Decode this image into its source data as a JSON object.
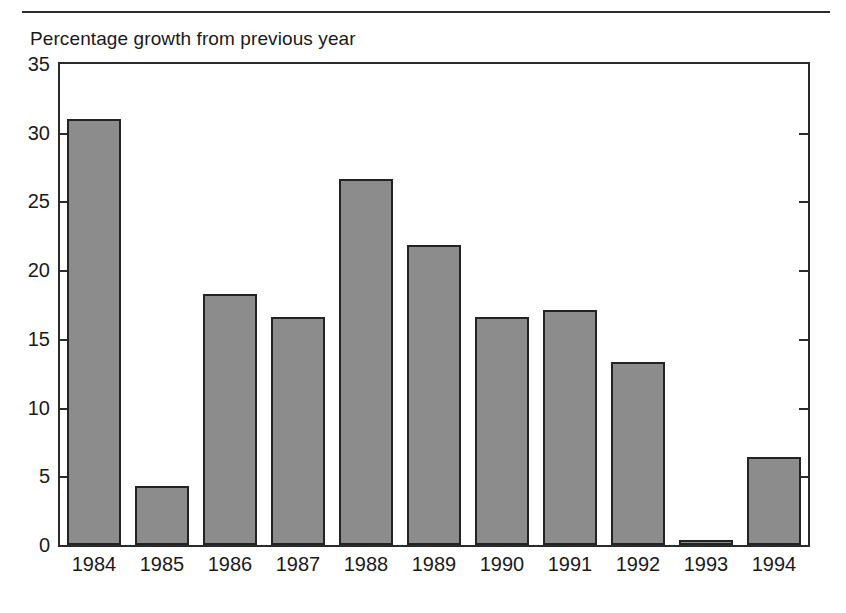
{
  "chart_data": {
    "type": "bar",
    "title": "Percentage growth from previous year",
    "xlabel": "",
    "ylabel": "",
    "categories": [
      "1984",
      "1985",
      "1986",
      "1987",
      "1988",
      "1989",
      "1990",
      "1991",
      "1992",
      "1993",
      "1994"
    ],
    "values": [
      31.0,
      4.3,
      18.3,
      16.6,
      26.6,
      21.8,
      16.6,
      17.1,
      13.3,
      0.4,
      6.4
    ],
    "ylim": [
      0,
      35
    ],
    "yticks": [
      0,
      5,
      10,
      15,
      20,
      25,
      30,
      35
    ],
    "ytick_labels": [
      "0",
      "5",
      "10",
      "15",
      "20",
      "25",
      "30",
      "35"
    ],
    "grid": false,
    "legend": null,
    "legend_position": "none",
    "series": [
      {
        "name": "Percentage growth from previous year",
        "values": [
          31.0,
          4.3,
          18.3,
          16.6,
          26.6,
          21.8,
          16.6,
          17.1,
          13.3,
          0.4,
          6.4
        ]
      }
    ],
    "colors": {
      "bar_fill": "#8c8c8c",
      "bar_edge": "#232323",
      "axis": "#2b2b2b",
      "text": "#1a1a1a",
      "background": "#ffffff"
    }
  }
}
